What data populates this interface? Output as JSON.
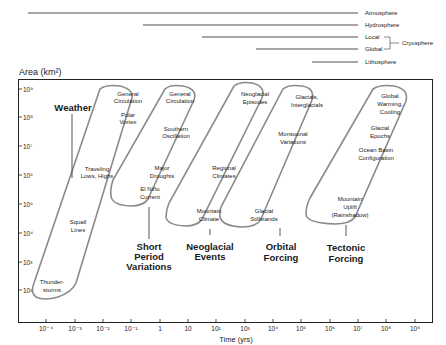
{
  "figure": {
    "y_axis_label": "Area (km²)",
    "x_axis_label": "Time (yrs)",
    "y_ticks": [
      "10⁹",
      "10⁸",
      "10⁷",
      "10⁶",
      "10⁵",
      "10⁴",
      "10³",
      "10²"
    ],
    "x_ticks": [
      "10⁻⁴",
      "10⁻³",
      "10⁻²",
      "10⁻¹",
      "1",
      "10",
      "10²",
      "10³",
      "10⁴",
      "10⁵",
      "10⁶",
      "10⁷",
      "10⁸",
      "10⁹"
    ]
  },
  "spheres": [
    {
      "label": "Atmosphere"
    },
    {
      "label": "Hydrosphere"
    },
    {
      "label": "Local"
    },
    {
      "label": "Global"
    },
    {
      "label": "Lithosphere"
    }
  ],
  "cryosphere_label": "Cryosphere",
  "groups": [
    {
      "title_lines": [
        "Weather"
      ],
      "items": [
        [
          "General",
          "Circulation"
        ],
        [
          "Polar",
          "Vortex"
        ],
        [
          "Traveling",
          "Lows, Highs"
        ],
        [
          "Squall",
          "Lines"
        ],
        [
          "Thunder-",
          "storms"
        ]
      ]
    },
    {
      "title_lines": [
        "Short",
        "Period",
        "Variations"
      ],
      "items": [
        [
          "General",
          "Circulation"
        ],
        [
          "Southern",
          "Oscillation"
        ],
        [
          "Major",
          "Droughts"
        ],
        [
          "El Niño",
          "Current"
        ]
      ]
    },
    {
      "title_lines": [
        "Neoglacial",
        "Events"
      ],
      "items": [
        [
          "Neoglacial",
          "Episodes"
        ],
        [
          "Regional",
          "Climates"
        ],
        [
          "Mountain",
          "Climate"
        ]
      ]
    },
    {
      "title_lines": [
        "Orbital",
        "Forcing"
      ],
      "items": [
        [
          "Glacials,",
          "Interglacials"
        ],
        [
          "Monsoonal",
          "Variations"
        ],
        [
          "Glacial",
          "Stillstands"
        ]
      ]
    },
    {
      "title_lines": [
        "Tectonic",
        "Forcing"
      ],
      "items": [
        [
          "Global",
          "Warming,",
          "Cooling"
        ],
        [
          "Glacial",
          "Epochs"
        ],
        [
          "Ocean Basin",
          "Configuration"
        ],
        [
          "Mountain",
          "Uplift",
          "(Rainshadow)"
        ]
      ]
    }
  ]
}
